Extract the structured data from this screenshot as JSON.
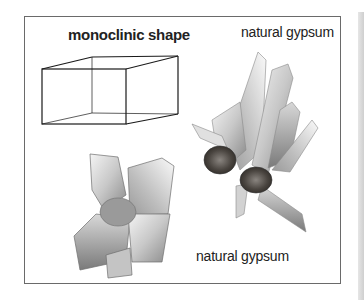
{
  "figure": {
    "diagram_title": "monoclinic shape",
    "captions": {
      "top_crystal": "natural gypsum",
      "bottom_crystal": "natural gypsum"
    },
    "colors": {
      "frame": "#6a6a6a",
      "text": "#222222",
      "crystal_light": "#f2f2f2",
      "crystal_mid": "#b8b8b8",
      "crystal_dark": "#6e6e6e",
      "matrix_rock": "#4a4540"
    }
  }
}
